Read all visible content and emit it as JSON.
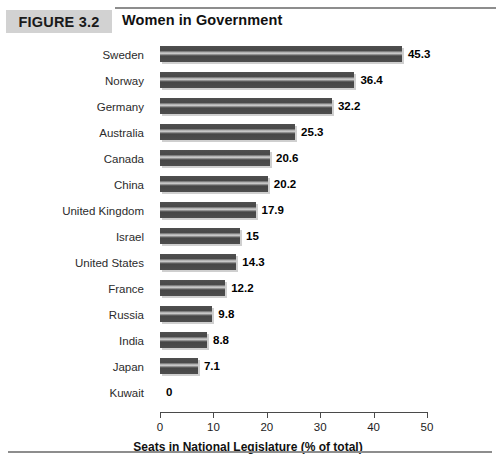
{
  "figure": {
    "badge_label": "FIGURE 3.2",
    "title": "Women in Government",
    "badge_color": "#d2d2d2",
    "rule_color": "#8d8d8d"
  },
  "chart_data": {
    "type": "bar",
    "orientation": "horizontal",
    "title": "Women in Government",
    "xlabel": "Seats in National Legislature (% of total)",
    "ylabel": "",
    "xlim": [
      0,
      50
    ],
    "xticks": [
      0,
      10,
      20,
      30,
      40,
      50
    ],
    "xtick_labels": [
      "0",
      "10",
      "20",
      "30",
      "40",
      "50"
    ],
    "grid": false,
    "legend": false,
    "bar_color": "#4b4b4b",
    "categories": [
      "Sweden",
      "Norway",
      "Germany",
      "Australia",
      "Canada",
      "China",
      "United Kingdom",
      "Israel",
      "United States",
      "France",
      "Russia",
      "India",
      "Japan",
      "Kuwait"
    ],
    "values": [
      45.3,
      36.4,
      32.2,
      25.3,
      20.6,
      20.2,
      17.9,
      15,
      14.3,
      12.2,
      9.8,
      8.8,
      7.1,
      0
    ],
    "value_labels": [
      "45.3",
      "36.4",
      "32.2",
      "25.3",
      "20.6",
      "20.2",
      "17.9",
      "15",
      "14.3",
      "12.2",
      "9.8",
      "8.8",
      "7.1",
      "0"
    ]
  }
}
